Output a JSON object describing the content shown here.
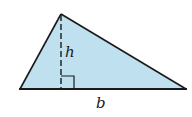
{
  "diagram": {
    "shape": "triangle",
    "fill_color": "#bfe0ee",
    "stroke_color": "#1a1a1a",
    "vertices": {
      "apex": [
        61,
        14
      ],
      "bottom_left": [
        20,
        89
      ],
      "bottom_right": [
        186,
        89
      ]
    },
    "labels": {
      "height": "h",
      "base": "b"
    },
    "height_line": "dashed",
    "right_angle_marker": true
  }
}
